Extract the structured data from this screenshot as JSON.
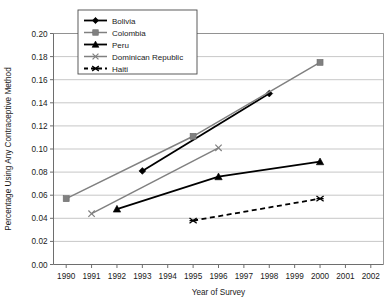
{
  "chart_data": {
    "type": "line",
    "title": "",
    "xlabel": "Year of Survey",
    "ylabel": "Percentage Using Any Contraceptive Method",
    "xlim": [
      1989.5,
      2002.5
    ],
    "ylim": [
      0.0,
      0.2
    ],
    "grid": true,
    "legend_position": "top-left-inside",
    "x_ticks": [
      "1990",
      "1991",
      "1992",
      "1993",
      "1994",
      "1995",
      "1996",
      "1997",
      "1998",
      "1999",
      "2000",
      "2001",
      "2002"
    ],
    "y_ticks": [
      "0.00",
      "0.02",
      "0.04",
      "0.06",
      "0.08",
      "0.10",
      "0.12",
      "0.14",
      "0.16",
      "0.18",
      "0.20"
    ],
    "series": [
      {
        "name": "Bolivia",
        "color": "#000000",
        "marker": "diamond",
        "line_style": "solid",
        "x": [
          1993,
          1998
        ],
        "y": [
          0.081,
          0.148
        ]
      },
      {
        "name": "Colombia",
        "color": "#808080",
        "marker": "square",
        "line_style": "solid",
        "x": [
          1990,
          1995,
          2000
        ],
        "y": [
          0.057,
          0.111,
          0.175
        ]
      },
      {
        "name": "Peru",
        "color": "#000000",
        "marker": "triangle",
        "line_style": "solid",
        "x": [
          1992,
          1996,
          2000
        ],
        "y": [
          0.048,
          0.076,
          0.089
        ]
      },
      {
        "name": "Dominican Republic",
        "color": "#808080",
        "marker": "cross",
        "line_style": "solid",
        "x": [
          1991,
          1996
        ],
        "y": [
          0.044,
          0.101
        ]
      },
      {
        "name": "Haiti",
        "color": "#000000",
        "marker": "asterisk",
        "line_style": "dashed",
        "x": [
          1995,
          2000
        ],
        "y": [
          0.038,
          0.057
        ]
      }
    ]
  },
  "legend": {
    "entries": [
      {
        "label": "Bolivia"
      },
      {
        "label": "Colombia"
      },
      {
        "label": "Peru"
      },
      {
        "label": "Dominican Republic"
      },
      {
        "label": "Haiti"
      }
    ]
  }
}
